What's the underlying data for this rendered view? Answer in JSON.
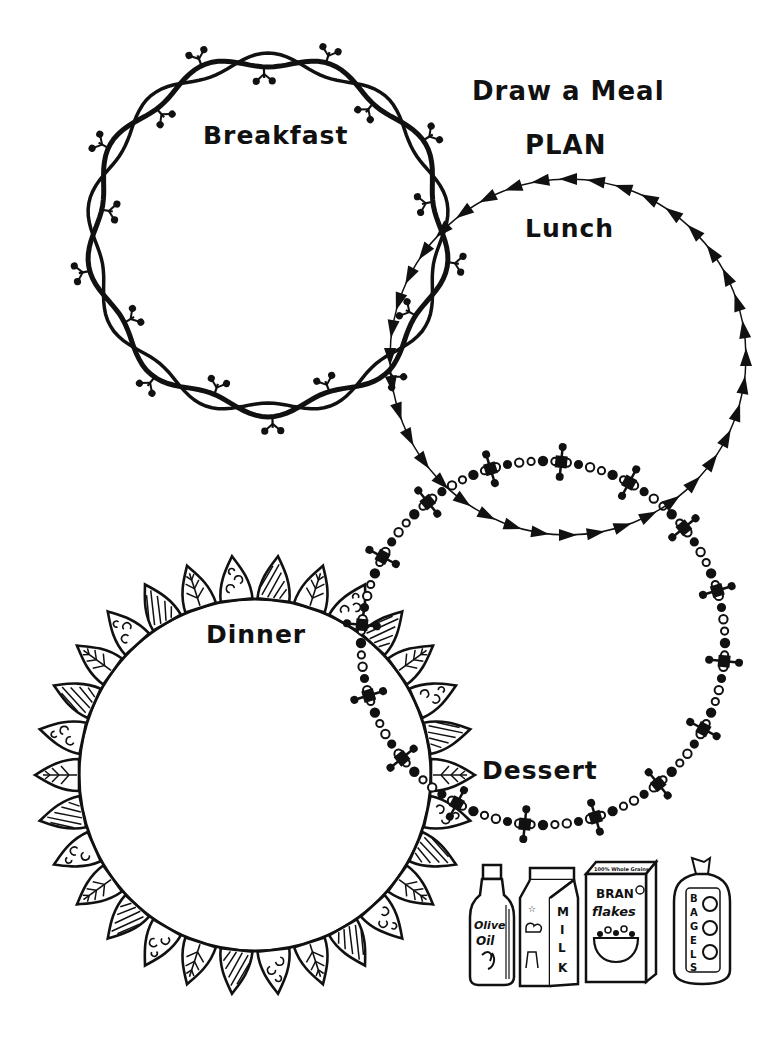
{
  "worksheet": {
    "title_line1": "Draw a Meal",
    "title_line2": "PLAN",
    "ink_color": "#111111",
    "background_color": "#ffffff"
  },
  "meals": [
    {
      "id": "breakfast",
      "label": "Breakfast",
      "border_style": "thorny-vine-wreath"
    },
    {
      "id": "lunch",
      "label": "Lunch",
      "border_style": "triangle-arrows"
    },
    {
      "id": "dinner",
      "label": "Dinner",
      "border_style": "decorated-leaves"
    },
    {
      "id": "dessert",
      "label": "Dessert",
      "border_style": "beaded-chain-with-crosses"
    }
  ],
  "pantry_items": [
    {
      "id": "olive-oil",
      "label_line1": "Olive",
      "label_line2": "Oil"
    },
    {
      "id": "milk",
      "label": "MILK"
    },
    {
      "id": "bran-flakes",
      "top_text": "100% Whole Grains",
      "label_line1": "BRAN",
      "label_line2": "flakes"
    },
    {
      "id": "bagels",
      "label": "BAGELS"
    }
  ]
}
